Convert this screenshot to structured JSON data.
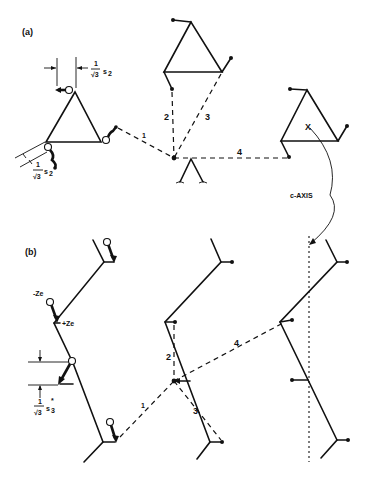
{
  "figure": {
    "panel_a": {
      "label": "(a)",
      "dimension_label_top": {
        "num": "1",
        "den": "√3",
        "sym": "s",
        "sub": "2"
      },
      "dimension_label_left": {
        "num": "1",
        "den": "√3",
        "sym": "s",
        "sub": "2"
      },
      "distance_labels": [
        "1",
        "2",
        "3",
        "4"
      ],
      "axis_label": "c-AXIS",
      "axis_marker": "X"
    },
    "panel_b": {
      "label": "(b)",
      "charge_neg": "-Ze",
      "charge_pos": "+Ze",
      "dimension_label": {
        "num": "1",
        "den": "√3",
        "sym": "s",
        "sub": "3",
        "sup": "*"
      },
      "distance_labels": [
        "1",
        "2",
        "3",
        "4"
      ]
    }
  }
}
